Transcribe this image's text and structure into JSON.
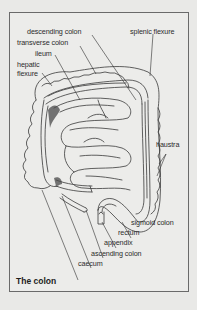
{
  "figure": {
    "title": "The colon",
    "frame_color": "#6a6a6a",
    "background": "#ececea",
    "line_color": "#3a3a3a"
  },
  "labels": {
    "descending_colon": "descending colon",
    "splenic_flexure": "splenic flexure",
    "transverse_colon": "transverse colon",
    "ileum": "ileum",
    "hepatic_flexure_line1": "hepatic",
    "hepatic_flexure_line2": "flexure",
    "haustra": "haustra",
    "sigmoid_colon": "sigmoid colon",
    "rectum": "rectum",
    "appendix": "appendix",
    "ascending_colon": "ascending colon",
    "caecum": "caecum"
  }
}
